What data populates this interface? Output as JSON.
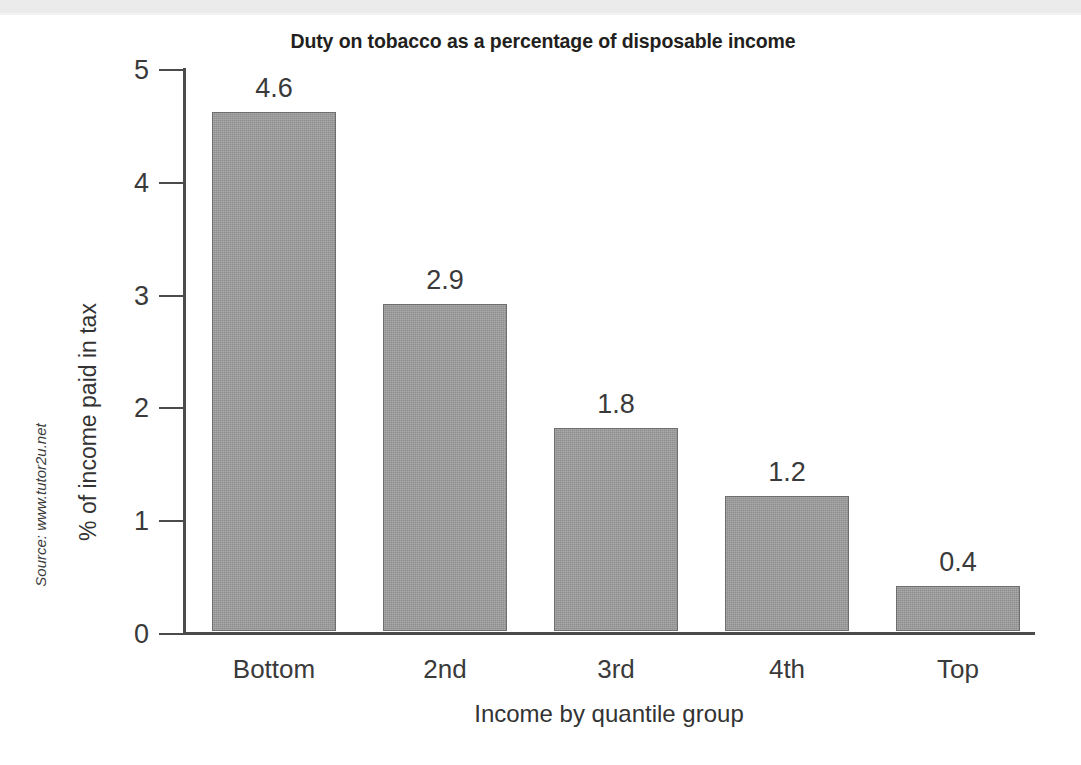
{
  "chart_data": {
    "type": "bar",
    "title": "Duty on tobacco as a percentage of disposable income",
    "xlabel": "Income by quantile group",
    "ylabel": "% of income paid in tax",
    "categories": [
      "Bottom",
      "2nd",
      "3rd",
      "4th",
      "Top"
    ],
    "values": [
      4.6,
      2.9,
      1.8,
      1.2,
      0.4
    ],
    "value_labels": [
      "4.6",
      "2.9",
      "1.8",
      "1.2",
      "0.4"
    ],
    "ylim": [
      0,
      5
    ],
    "ytick_labels": [
      "0",
      "1",
      "2",
      "3",
      "4",
      "5"
    ],
    "ytick_values": [
      0,
      1,
      2,
      3,
      4,
      5
    ],
    "grid": false,
    "legend": false,
    "bar_fill_color": "#9a9a9a",
    "bar_border_color": "#6e6e6e",
    "axis_color": "#4b4b4b",
    "text_color": "#3a3a3a",
    "background_color": "#ffffff"
  },
  "source": {
    "note": "Source: www.tutor2u.net"
  }
}
